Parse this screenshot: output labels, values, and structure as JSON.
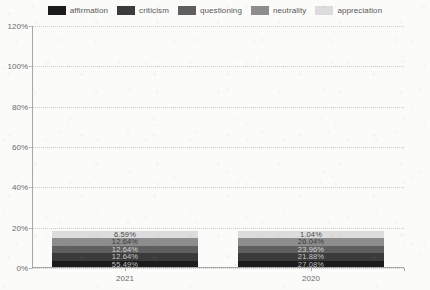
{
  "chart_data": {
    "type": "bar",
    "stacked": true,
    "title": "",
    "subtitle": "",
    "xlabel": "",
    "ylabel": "",
    "categories": [
      "2021",
      "2020"
    ],
    "ylim": [
      0,
      120
    ],
    "ytick_labels": [
      "0%",
      "20%",
      "40%",
      "60%",
      "80%",
      "100%",
      "120%"
    ],
    "ytick_values": [
      0,
      20,
      40,
      60,
      80,
      100,
      120
    ],
    "grid": true,
    "legend_position": "top",
    "value_suffix": "%",
    "series": [
      {
        "name": "affirmation",
        "color": "#1b1b1b",
        "label_color": "#bdbdbd",
        "values": [
          55.49,
          27.08
        ],
        "value_labels": [
          "55.49%",
          "27.08%"
        ]
      },
      {
        "name": "criticism",
        "color": "#3b3b3b",
        "label_color": "#c6c6c6",
        "values": [
          12.64,
          21.88
        ],
        "value_labels": [
          "12.64%",
          "21.88%"
        ]
      },
      {
        "name": "questioning",
        "color": "#5f5f5f",
        "label_color": "#d5d5d5",
        "values": [
          12.64,
          23.96
        ],
        "value_labels": [
          "12.64%",
          "23.96%"
        ]
      },
      {
        "name": "neutrality",
        "color": "#8d8d8d",
        "label_color": "#3a3a3a",
        "values": [
          12.64,
          26.04
        ],
        "value_labels": [
          "12.64%",
          "26.04%"
        ]
      },
      {
        "name": "appreciation",
        "color": "#dcdcdc",
        "label_color": "#4a4a4a",
        "values": [
          6.59,
          1.04
        ],
        "value_labels": [
          "6.59%",
          "1.04%"
        ]
      }
    ]
  }
}
